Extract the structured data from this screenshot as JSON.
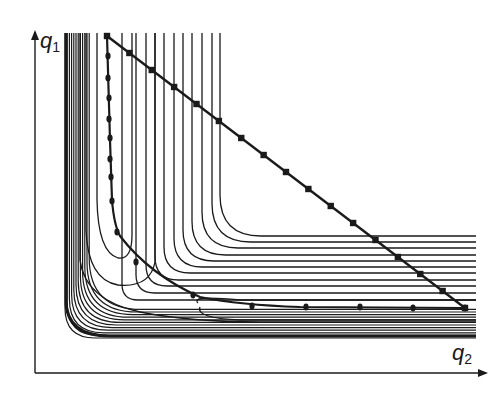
{
  "figure": {
    "type": "contour-plot-with-optimization-paths",
    "axes": {
      "y_axis": {
        "label_base": "q",
        "label_sub": "1"
      },
      "x_axis": {
        "label_base": "q",
        "label_sub": "2"
      }
    },
    "colors": {
      "ink": "#1a1a1a",
      "background": "#ffffff"
    },
    "paths": [
      {
        "name": "straight-path",
        "marker": "square",
        "description": "Straight diagonal path from top-left start to bottom-right end"
      },
      {
        "name": "curved-path",
        "marker": "dot",
        "description": "Path descending vertically along valley then running horizontally to end point"
      }
    ]
  }
}
